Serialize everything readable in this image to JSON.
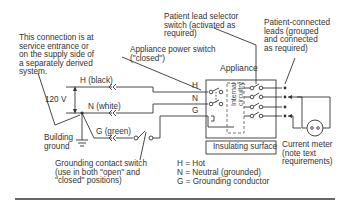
{
  "diagram": {
    "notes": {
      "connection_note": "This connection is at\nservice entrance or\non the supply side of\na separately derived\nsystem.",
      "patient_lead_selector": "Patient lead selector\nswitch (activated as\nrequired)",
      "patient_connected_leads": "Patient-connected\nleads (grouped\nand connected\nas required)",
      "appliance_power_switch": "Appliance power switch\n(\"closed\")",
      "appliance": "Appliance",
      "grounding_contact_switch": "Grounding contact switch\n(use in both \"open\" and\n\"closed\" positions)",
      "building_ground": "Building\nground",
      "insulating_surface": "Insulating surface",
      "current_meter": "Current meter\n(note text\nrequirements)",
      "internal_circuitry": "Internal\ncircuitry"
    },
    "wires": {
      "hot": "H (black)",
      "neutral": "N (white)",
      "ground": "G (green)",
      "voltage": "120 V"
    },
    "terminals": [
      "H",
      "N",
      "G"
    ],
    "legend": [
      "H = Hot",
      "N = Neutral (grounded)",
      "G = Grounding conductor"
    ]
  }
}
